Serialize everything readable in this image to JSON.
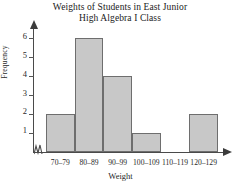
{
  "chart_data": {
    "type": "bar",
    "title": "Weights of Students in East Junior High Algebra I Class",
    "title_line1": "Weights of Students in East Junior",
    "title_line2": "High Algebra I Class",
    "categories": [
      "70–79",
      "80–89",
      "90–99",
      "100–109",
      "110–119",
      "120–129"
    ],
    "values": [
      2,
      6,
      4,
      1,
      0,
      2
    ],
    "xlabel": "Weight",
    "ylabel": "Frequency",
    "ylim": [
      0,
      6.6
    ],
    "yticks": [
      1,
      2,
      3,
      4,
      5,
      6
    ],
    "ytick_labels": [
      "1",
      "2",
      "3",
      "4",
      "5",
      "6"
    ],
    "grid": false,
    "legend": false,
    "bar_fill_color": "#c8c8c8",
    "bar_border_color": "#6e6e6e",
    "axis_color": "#4a4a4a",
    "axis_break": "zigzag-x-origin",
    "axis_arrows": [
      "y-up",
      "x-right"
    ]
  }
}
